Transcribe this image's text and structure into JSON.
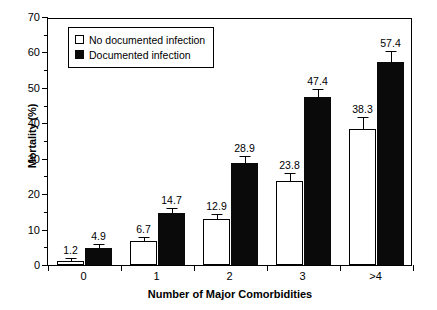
{
  "chart_data": {
    "type": "bar",
    "title": "",
    "xlabel": "Number of Major Comorbidities",
    "ylabel": "Mortality (%)",
    "categories": [
      "0",
      "1",
      "2",
      "3",
      ">4"
    ],
    "ylim": [
      0,
      70
    ],
    "yticks": [
      0,
      10,
      20,
      30,
      40,
      50,
      60,
      70
    ],
    "ytick_labels": [
      "0",
      "10",
      "20",
      "30",
      "40",
      "50",
      "60",
      "70"
    ],
    "yminor_step": 5,
    "grid": false,
    "legend_position": "upper-left-inside",
    "series": [
      {
        "name": "No documented infection",
        "style": "open",
        "values": [
          1.2,
          6.7,
          12.9,
          23.8,
          38.3
        ],
        "labels": [
          "1.2",
          "6.7",
          "12.9",
          "23.8",
          "38.3"
        ],
        "errors": [
          0.4,
          0.9,
          1.2,
          2.0,
          3.2
        ]
      },
      {
        "name": "Documented infection",
        "style": "filled",
        "values": [
          4.9,
          14.7,
          28.9,
          47.4,
          57.4
        ],
        "labels": [
          "4.9",
          "14.7",
          "28.9",
          "47.4",
          "57.4"
        ],
        "errors": [
          0.8,
          1.1,
          1.5,
          2.0,
          2.6
        ]
      }
    ]
  },
  "legend": {
    "items": [
      {
        "label": "No documented infection",
        "style": "open"
      },
      {
        "label": "Documented infection",
        "style": "filled"
      }
    ]
  }
}
